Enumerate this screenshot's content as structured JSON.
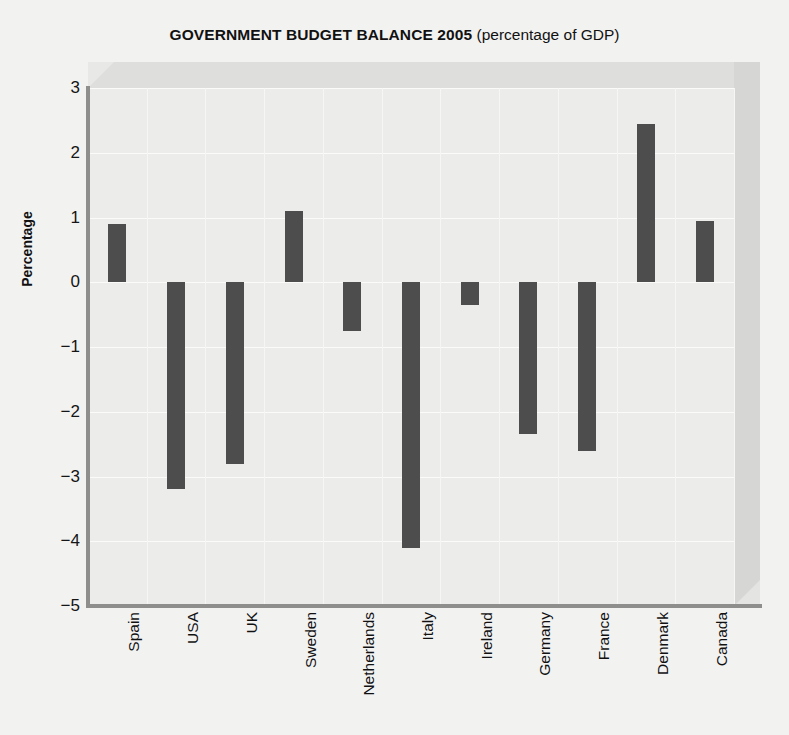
{
  "chart_data": {
    "type": "bar",
    "title": "GOVERNMENT BUDGET BALANCE 2005 (percentage of GDP)",
    "title_main": "GOVERNMENT BUDGET BALANCE 2005",
    "title_sub": " (percentage of GDP)",
    "xlabel": "",
    "ylabel": "Percentage",
    "ylim": [
      -5,
      3
    ],
    "yticks": [
      3,
      2,
      1,
      0,
      -1,
      -2,
      -3,
      -4,
      -5
    ],
    "ytick_labels": [
      "3",
      "2",
      "1",
      "0",
      "−1",
      "−2",
      "−3",
      "−4",
      "−5"
    ],
    "grid": true,
    "legend": "none",
    "bar_color": "#4d4d4d",
    "background_color": "#ececea",
    "figure_background": "#f2f2f1",
    "categories": [
      "Spain",
      "USA",
      "UK",
      "Sweden",
      "Netherlands",
      "Italy",
      "Ireland",
      "Germany",
      "France",
      "Denmark",
      "Canada"
    ],
    "values": [
      0.9,
      -3.2,
      -2.8,
      1.1,
      -0.75,
      -4.1,
      -0.35,
      -2.35,
      -2.6,
      2.45,
      0.95
    ]
  }
}
